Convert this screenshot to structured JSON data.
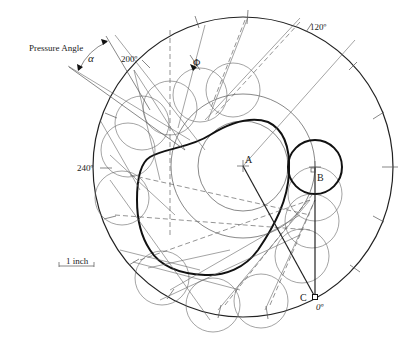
{
  "figure": {
    "labels": {
      "pressure_angle": "Pressure Angle",
      "alpha": "α",
      "phi": "Φ",
      "deg_200": "200º",
      "deg_120": "120º",
      "deg_240": "240º",
      "deg_0": "0º",
      "point_a": "A",
      "point_b": "B",
      "point_c": "C",
      "scale": "1 inch"
    },
    "geometry": {
      "cam_center": [
        243,
        166
      ],
      "outer_circle_radius": 150,
      "prime_circle_radius": 72,
      "base_circle_radius": 45,
      "roller_radius": 27,
      "follower_point_b": [
        315,
        167
      ],
      "point_c": [
        315,
        297
      ]
    },
    "colors": {
      "line": "#222222",
      "construction": "#666666",
      "background": "#ffffff"
    }
  }
}
